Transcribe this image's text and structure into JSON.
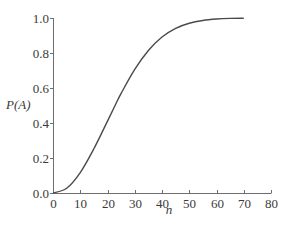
{
  "chart_data": {
    "type": "line",
    "title": "",
    "xlabel": "n",
    "ylabel": "P(A)",
    "xlim": [
      0,
      80
    ],
    "ylim": [
      0.0,
      1.0
    ],
    "xticks": [
      0,
      10,
      20,
      30,
      40,
      50,
      60,
      70,
      80
    ],
    "yticks": [
      0.0,
      0.2,
      0.4,
      0.6,
      0.8,
      1.0
    ],
    "xtick_labels": [
      "0",
      "10",
      "20",
      "30",
      "40",
      "50",
      "60",
      "70",
      "80"
    ],
    "ytick_labels": [
      "0.0",
      "0.2",
      "0.4",
      "0.6",
      "0.8",
      "1.0"
    ],
    "grid": false,
    "legend": null,
    "series": [
      {
        "name": "P(A)",
        "color": "#4a4a4a",
        "x": [
          0,
          5,
          10,
          15,
          20,
          23,
          25,
          30,
          35,
          40,
          45,
          50,
          55,
          60,
          65,
          70
        ],
        "y": [
          0.0,
          0.027,
          0.117,
          0.253,
          0.411,
          0.507,
          0.569,
          0.706,
          0.814,
          0.891,
          0.941,
          0.97,
          0.986,
          0.994,
          0.998,
          0.999
        ]
      }
    ]
  },
  "labels": {
    "xlabel": "n",
    "ylabel": "P(A)"
  }
}
